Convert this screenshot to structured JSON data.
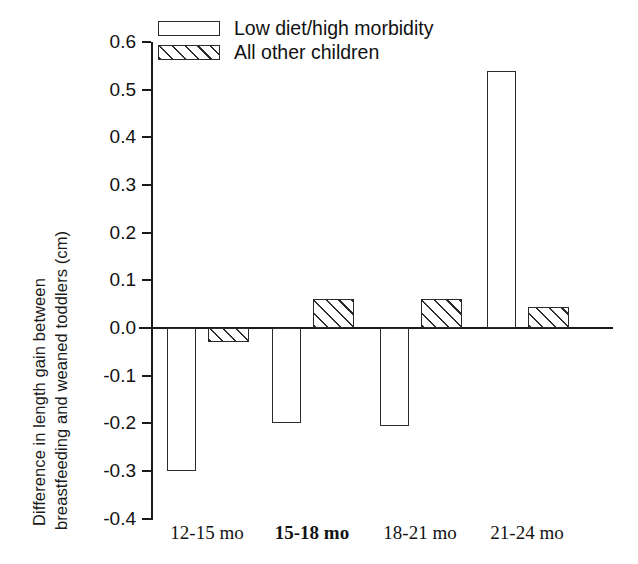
{
  "chart_data": {
    "type": "bar",
    "title": "",
    "xlabel": "",
    "ylabel_line1": "Difference in length gain between",
    "ylabel_line2": "breastfeeding and weaned toddlers (cm)",
    "categories": [
      "12-15 mo",
      "15-18 mo",
      "18-21 mo",
      "21-24 mo"
    ],
    "series": [
      {
        "name": "Low diet/high morbidity",
        "style": "open",
        "values": [
          -0.3,
          -0.2,
          -0.205,
          0.54
        ]
      },
      {
        "name": "All other children",
        "style": "hatched",
        "values": [
          -0.03,
          0.06,
          0.06,
          0.045
        ]
      }
    ],
    "yticks": [
      "0.6",
      "0.5",
      "0.4",
      "0.3",
      "0.2",
      "0.1",
      "0.0",
      "-0.1",
      "-0.2",
      "-0.3",
      "-0.4"
    ],
    "ytick_values": [
      0.6,
      0.5,
      0.4,
      0.3,
      0.2,
      0.1,
      0.0,
      -0.1,
      -0.2,
      -0.3,
      -0.4
    ],
    "ylim": [
      -0.4,
      0.6
    ],
    "grid": false,
    "legend_position": "top-left",
    "zero_line": 0.0,
    "axis_color": "#1a1a1a"
  },
  "legend": {
    "entries": [
      {
        "label": "Low diet/high morbidity",
        "style": "open"
      },
      {
        "label": "All other children",
        "style": "hatched"
      }
    ]
  }
}
